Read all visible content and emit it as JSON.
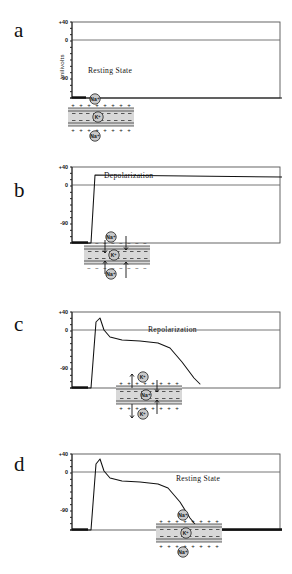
{
  "figure": {
    "axis_label": "milivolts",
    "y_ticks": [
      "+40",
      "0",
      "-90"
    ],
    "ylim": [
      -90,
      40
    ]
  },
  "panels": [
    {
      "letter": "a",
      "label": "Resting  State",
      "label_x": 88,
      "label_y": 66,
      "top": 0,
      "curve": "M0,78 L16,78 L212,78",
      "baseline_segments": [
        [
          0,
          16
        ]
      ],
      "membrane": {
        "ion_top": "Na⁺",
        "ion_bottom": "Na⁺",
        "ion_inside": "K⁺",
        "outer_charge": "+",
        "inner_charge": "−",
        "arrows": "none"
      }
    },
    {
      "letter": "b",
      "label": "Depolarization",
      "label_x": 104,
      "label_y": 171,
      "top": 145,
      "curve": "M0,78 L16,78 L21,78 L25,10 L212,12",
      "baseline_segments": [
        [
          0,
          18
        ]
      ],
      "membrane": {
        "ion_top": "Na⁺",
        "ion_bottom": "Na⁺",
        "ion_inside": "K⁺",
        "outer_charge": "−",
        "inner_charge": "+",
        "arrows": "influx"
      }
    },
    {
      "letter": "c",
      "label": "Repolarization",
      "label_x": 148,
      "label_y": 325,
      "top": 290,
      "curve": "M0,78 L16,78 L21,78 L26,12 L30,8 L34,20 L40,27 L52,30 L70,31 L88,33 L100,38 L112,52 L124,68 L130,74",
      "baseline_segments": [
        [
          0,
          18
        ]
      ],
      "membrane": {
        "ion_top": "K⁺",
        "ion_bottom": "K⁺",
        "ion_inside": "Na⁺",
        "outer_charge": "+",
        "inner_charge": "−",
        "arrows": "efflux"
      }
    },
    {
      "letter": "d",
      "label": "Resting  State",
      "label_x": 176,
      "label_y": 474,
      "top": 432,
      "curve": "M0,78 L16,78 L21,78 L26,12 L30,7 L34,19 L40,26 L52,29 L70,30 L88,32 L98,36 L110,50 L120,66 L128,76 L134,78 L212,78",
      "baseline_segments": [
        [
          0,
          18
        ],
        [
          134,
          212
        ]
      ],
      "membrane": {
        "ion_top": "Na⁺",
        "ion_bottom": "Na⁺",
        "ion_inside": "K⁺",
        "outer_charge": "+",
        "inner_charge": "−",
        "arrows": "none"
      }
    }
  ],
  "membrane_positions": [
    {
      "left": 62,
      "top": 92
    },
    {
      "left": 78,
      "top": 230
    },
    {
      "left": 110,
      "top": 370
    },
    {
      "left": 150,
      "top": 508
    }
  ],
  "letter_positions": [
    18,
    178,
    312,
    452
  ]
}
